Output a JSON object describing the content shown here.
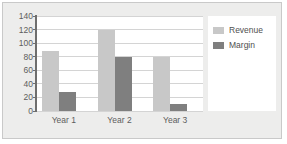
{
  "chart_data": {
    "type": "bar",
    "title": "",
    "subtitle": "",
    "xlabel": "",
    "ylabel": "",
    "categories": [
      "Year 1",
      "Year 2",
      "Year 3"
    ],
    "series": [
      {
        "name": "Revenue",
        "values": [
          88,
          120,
          80
        ],
        "color": "#c8c8c8"
      },
      {
        "name": "Margin",
        "values": [
          28,
          80,
          11
        ],
        "color": "#7f7f7f"
      }
    ],
    "ylim": [
      0,
      140
    ],
    "ytick_values": [
      0,
      20,
      40,
      60,
      80,
      100,
      120,
      140
    ],
    "ytick_labels": [
      "0",
      "20",
      "40",
      "60",
      "80",
      "100",
      "120",
      "140"
    ],
    "grid": true,
    "grid_axis": "y",
    "legend": true,
    "legend_position": "right",
    "grouping": "clustered"
  },
  "style": {
    "frame_background": "#ededec",
    "frame_border": "#c9c9c9",
    "plot_background": "#ffffff",
    "gridline_color": "#d4d4d4",
    "axis_color": "#6e6e6e",
    "tick_label_color": "#5d5d5d",
    "legend_background": "#ffffff"
  }
}
